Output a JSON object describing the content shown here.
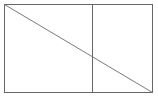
{
  "canvas": {
    "width": 158,
    "height": 98,
    "background_color": "#ffffff"
  },
  "figure": {
    "name": "rectangle-with-vertical-divider-and-diagonal",
    "stroke_color": "#666666",
    "diagonal_stroke_color": "#7a7a7a",
    "stroke_width": 1,
    "fill_color": "none",
    "rectangle": {
      "name": "outer-rectangle",
      "x": 4.5,
      "y": 4.5,
      "width": 148,
      "height": 88,
      "left": 4.5,
      "top": 4.5,
      "right": 152.5,
      "bottom": 92.5
    },
    "vertical_divider": {
      "name": "vertical-divider-line",
      "x": 92.5,
      "y1": 4.5,
      "y2": 92.5,
      "fraction_of_width": 0.595
    },
    "diagonal": {
      "name": "diagonal-line",
      "x1": 4.5,
      "y1": 4.5,
      "x2": 152.5,
      "y2": 92.5,
      "from_corner": "top-left",
      "to_corner": "bottom-right",
      "crossing_point": {
        "x": 92.5,
        "y": 57
      }
    },
    "regions": [
      {
        "name": "left-panel",
        "label": ""
      },
      {
        "name": "right-panel",
        "label": ""
      }
    ]
  }
}
